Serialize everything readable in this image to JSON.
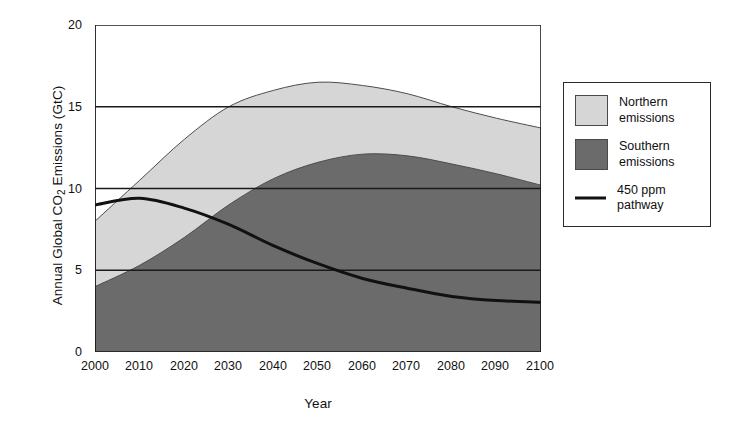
{
  "chart_data": {
    "type": "area",
    "title": "",
    "xlabel": "Year",
    "ylabel": "Annual Global CO2 Emissions (GtC)",
    "ylabel_prefix": "Annual Global CO",
    "ylabel_sub": "2",
    "ylabel_suffix": " Emissions (GtC)",
    "x": [
      2000,
      2010,
      2020,
      2030,
      2040,
      2050,
      2060,
      2070,
      2080,
      2090,
      2100
    ],
    "xlim": [
      2000,
      2100
    ],
    "ylim": [
      0,
      20
    ],
    "yticks": [
      0,
      5,
      10,
      15,
      20
    ],
    "xticks": [
      "2000",
      "2010",
      "2020",
      "2030",
      "2040",
      "2050",
      "2060",
      "2070",
      "2080",
      "2090",
      "2100"
    ],
    "grid": "horizontal",
    "legend_position": "right-outside",
    "stacked": true,
    "series": [
      {
        "name": "Southern emissions",
        "kind": "area",
        "color": "#6b6b6b",
        "values": [
          4.0,
          5.3,
          7.0,
          9.0,
          10.6,
          11.6,
          12.1,
          12.0,
          11.5,
          10.9,
          10.2
        ]
      },
      {
        "name": "Northern emissions",
        "kind": "area",
        "color": "#d6d6d6",
        "note": "plotted as stacked band above Southern; values are the Northern-only component",
        "values": [
          4.0,
          5.2,
          6.0,
          6.0,
          5.4,
          4.9,
          4.2,
          3.8,
          3.5,
          3.4,
          3.5
        ],
        "cumulative_top": [
          8.0,
          10.5,
          13.0,
          15.0,
          16.0,
          16.5,
          16.3,
          15.8,
          15.0,
          14.3,
          13.7
        ]
      },
      {
        "name": "450 ppm pathway",
        "kind": "line",
        "color": "#111111",
        "values": [
          9.0,
          9.4,
          8.8,
          7.8,
          6.5,
          5.4,
          4.5,
          3.9,
          3.4,
          3.15,
          3.05
        ]
      }
    ],
    "annotations": {
      "total_peak_year": 2050,
      "total_peak_value": 16.5,
      "southern_peak_year": 2062,
      "southern_peak_value": 12.1,
      "pathway_peak_year": 2008,
      "pathway_peak_value": 9.4
    }
  },
  "legend": {
    "items": [
      {
        "label_line1": "Northern",
        "label_line2": "emissions",
        "marker": "swatch",
        "color": "#d6d6d6"
      },
      {
        "label_line1": "Southern",
        "label_line2": "emissions",
        "marker": "swatch",
        "color": "#6b6b6b"
      },
      {
        "label_line1": "450 ppm",
        "label_line2": "pathway",
        "marker": "line",
        "color": "#111111"
      }
    ]
  },
  "colors": {
    "northern": "#d6d6d6",
    "southern": "#6b6b6b",
    "pathway": "#111111",
    "axis": "#1a1a1a",
    "background": "#ffffff"
  }
}
